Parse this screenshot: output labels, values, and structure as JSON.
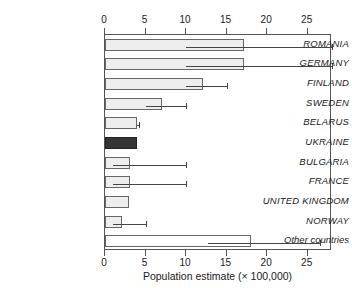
{
  "chart_data": {
    "type": "bar",
    "orientation": "horizontal",
    "title": "",
    "xlabel": "Population estimate (× 100,000)",
    "ylabel": "",
    "xlim": [
      0,
      28
    ],
    "xticks": [
      0,
      5,
      10,
      15,
      20,
      25
    ],
    "xtick_labels": [
      "0",
      "5",
      "10",
      "15",
      "20",
      "25"
    ],
    "grid": false,
    "legend": "none",
    "axis_top": true,
    "axis_bottom": true,
    "categories": [
      "ROMANIA",
      "GERMANY",
      "FINLAND",
      "SWEDEN",
      "BELARUS",
      "UKRAINE",
      "BULGARIA",
      "FRANCE",
      "UNITED KINGDOM",
      "NORWAY",
      "Other countries"
    ],
    "values": [
      17.2,
      17.2,
      12.1,
      7.0,
      4.0,
      4.0,
      3.1,
      3.1,
      3.0,
      2.1,
      18.0
    ],
    "error_low": [
      10.0,
      10.0,
      10.0,
      5.0,
      3.9,
      null,
      1.0,
      1.0,
      null,
      1.0,
      12.7
    ],
    "error_high": [
      28.0,
      28.0,
      15.0,
      10.0,
      4.2,
      null,
      10.0,
      10.0,
      null,
      5.0,
      26.5
    ],
    "bar_styles": [
      "light",
      "light",
      "light",
      "light",
      "light",
      "dark",
      "light",
      "light",
      "light",
      "light",
      "plain"
    ],
    "colors": {
      "bar_light_fill": "#eeeeee",
      "bar_dark_fill": "#353535",
      "bar_plain_fill": "#ffffff",
      "bar_stroke": "#666666",
      "error_bar": "#444444",
      "axis": "#555555",
      "text": "#1a1a1a",
      "background": "#ffffff"
    }
  }
}
